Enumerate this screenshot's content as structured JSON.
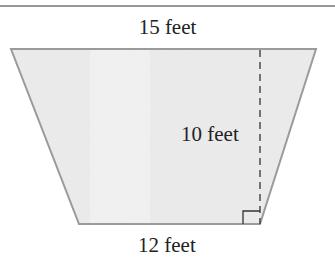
{
  "diagram": {
    "shape": "trapezoid",
    "labels": {
      "top_base": "15 feet",
      "bottom_base": "12 feet",
      "height": "10 feet"
    },
    "colors": {
      "fill": "#ececec",
      "outline": "#9a9a9a",
      "rule": "#333333",
      "dashed": "#333333",
      "text": "#222222"
    },
    "right_angle_marker": true
  }
}
